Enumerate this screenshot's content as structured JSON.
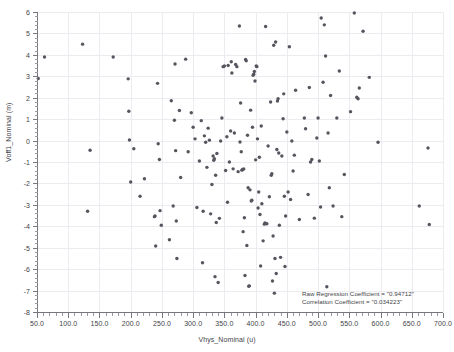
{
  "chart_data": {
    "type": "scatter",
    "title": "",
    "xlabel": "Vhys_Nominal (u)",
    "ylabel": "Voff1_Nominal (m)",
    "xlim": [
      50,
      700
    ],
    "ylim": [
      -8,
      6
    ],
    "grid": true,
    "legend": null,
    "xticks": [
      "50.0",
      "100.0",
      "150.0",
      "200.0",
      "250.0",
      "300.0",
      "350.0",
      "400.0",
      "450.0",
      "500.0",
      "550.0",
      "600.0",
      "650.0",
      "700.0"
    ],
    "xtick_values": [
      50,
      100,
      150,
      200,
      250,
      300,
      350,
      400,
      450,
      500,
      550,
      600,
      650,
      700
    ],
    "yticks": [
      "6",
      "5",
      "4",
      "3",
      "2",
      "1",
      "0",
      "-1",
      "-2",
      "-3",
      "-4",
      "-5",
      "-6",
      "-7",
      "-8"
    ],
    "ytick_values": [
      6,
      5,
      4,
      3,
      2,
      1,
      0,
      -1,
      -2,
      -3,
      -4,
      -5,
      -6,
      -7,
      -8
    ],
    "marker_color": "#55555e",
    "grid_color": "#ececf0",
    "axis_color": "#76767e",
    "annotations": [
      "Raw Regression Coefficient = \"0.94712\"",
      "Correlation Coefficient = \"0.034223\""
    ],
    "points": [
      [
        52,
        2.9
      ],
      [
        62,
        3.9
      ],
      [
        123,
        4.5
      ],
      [
        131,
        -3.3
      ],
      [
        135,
        -0.45
      ],
      [
        172,
        3.9
      ],
      [
        196,
        2.88
      ],
      [
        197,
        1.37
      ],
      [
        198,
        0.03
      ],
      [
        200,
        -1.93
      ],
      [
        205,
        -0.38
      ],
      [
        215,
        -2.6
      ],
      [
        222,
        -1.78
      ],
      [
        238,
        -3.55
      ],
      [
        239,
        -3.52
      ],
      [
        240,
        -4.92
      ],
      [
        243,
        2.67
      ],
      [
        244,
        -0.15
      ],
      [
        246,
        -0.88
      ],
      [
        247,
        -3.27
      ],
      [
        249,
        -3.95
      ],
      [
        262,
        -4.63
      ],
      [
        265,
        1.86
      ],
      [
        268,
        -3.05
      ],
      [
        270,
        0.95
      ],
      [
        271,
        3.57
      ],
      [
        272,
        -0.47
      ],
      [
        273,
        -3.75
      ],
      [
        274,
        -5.5
      ],
      [
        278,
        1.4
      ],
      [
        280,
        -1.72
      ],
      [
        288,
        3.8
      ],
      [
        292,
        -0.52
      ],
      [
        297,
        1.3
      ],
      [
        300,
        0.62
      ],
      [
        303,
        0.08
      ],
      [
        306,
        -3.12
      ],
      [
        310,
        -0.95
      ],
      [
        313,
        0.93
      ],
      [
        315,
        -5.7
      ],
      [
        316,
        -3.3
      ],
      [
        318,
        0.22
      ],
      [
        320,
        -0.08
      ],
      [
        322,
        -1.25
      ],
      [
        324,
        0.58
      ],
      [
        326,
        0.02
      ],
      [
        328,
        -3.42
      ],
      [
        330,
        -2.05
      ],
      [
        332,
        -0.72
      ],
      [
        333,
        -0.92
      ],
      [
        334,
        -0.85
      ],
      [
        335,
        -6.35
      ],
      [
        336,
        -1.62
      ],
      [
        337,
        -3.82
      ],
      [
        338,
        -0.6
      ],
      [
        340,
        -6.62
      ],
      [
        342,
        -3.63
      ],
      [
        344,
        -0.02
      ],
      [
        346,
        1.05
      ],
      [
        348,
        3.45
      ],
      [
        350,
        3.48
      ],
      [
        352,
        -1.4
      ],
      [
        354,
        0.18
      ],
      [
        355,
        -2.88
      ],
      [
        356,
        3.5
      ],
      [
        358,
        -1.0
      ],
      [
        360,
        0.45
      ],
      [
        361,
        3.68
      ],
      [
        362,
        3.15
      ],
      [
        364,
        -1.32
      ],
      [
        366,
        0.35
      ],
      [
        368,
        3.55
      ],
      [
        370,
        3.45
      ],
      [
        372,
        -1.45
      ],
      [
        374,
        5.35
      ],
      [
        375,
        -0.07
      ],
      [
        376,
        1.75
      ],
      [
        377,
        -0.52
      ],
      [
        378,
        -1.38
      ],
      [
        379,
        -1.35
      ],
      [
        380,
        -4.25
      ],
      [
        381,
        -1.33
      ],
      [
        382,
        -3.6
      ],
      [
        383,
        -6.3
      ],
      [
        384,
        3.78
      ],
      [
        385,
        3.72
      ],
      [
        386,
        -4.9
      ],
      [
        387,
        0.25
      ],
      [
        388,
        -2.2
      ],
      [
        389,
        -6.8
      ],
      [
        390,
        -6.78
      ],
      [
        391,
        -2.3
      ],
      [
        392,
        1.42
      ],
      [
        393,
        -2.82
      ],
      [
        394,
        -2.78
      ],
      [
        395,
        0.62
      ],
      [
        396,
        3.05
      ],
      [
        397,
        3.1
      ],
      [
        398,
        3.22
      ],
      [
        399,
        2.78
      ],
      [
        400,
        -0.9
      ],
      [
        401,
        3.48
      ],
      [
        402,
        3.45
      ],
      [
        403,
        0.08
      ],
      [
        404,
        -3.15
      ],
      [
        405,
        -2.4
      ],
      [
        406,
        -0.78
      ],
      [
        407,
        -3.45
      ],
      [
        408,
        -5.85
      ],
      [
        409,
        0.68
      ],
      [
        410,
        -2.95
      ],
      [
        412,
        -4.68
      ],
      [
        414,
        -3.9
      ],
      [
        415,
        -3.85
      ],
      [
        416,
        5.32
      ],
      [
        418,
        -3.88
      ],
      [
        420,
        -0.25
      ],
      [
        422,
        -2.62
      ],
      [
        424,
        1.8
      ],
      [
        425,
        -1.62
      ],
      [
        426,
        -1.55
      ],
      [
        427,
        -6.55
      ],
      [
        428,
        -4.45
      ],
      [
        429,
        4.45
      ],
      [
        430,
        -7.12
      ],
      [
        431,
        -5.5
      ],
      [
        432,
        4.6
      ],
      [
        433,
        -6.2
      ],
      [
        434,
        -0.42
      ],
      [
        435,
        1.85
      ],
      [
        436,
        1.95
      ],
      [
        437,
        -0.58
      ],
      [
        438,
        -3.95
      ],
      [
        440,
        -5.45
      ],
      [
        442,
        -0.72
      ],
      [
        444,
        1.02
      ],
      [
        445,
        2.18
      ],
      [
        446,
        -2.6
      ],
      [
        447,
        -5.88
      ],
      [
        448,
        -3.52
      ],
      [
        450,
        0.4
      ],
      [
        452,
        -2.4
      ],
      [
        454,
        4.38
      ],
      [
        456,
        -2.75
      ],
      [
        458,
        -0.02
      ],
      [
        460,
        -1.42
      ],
      [
        462,
        -0.68
      ],
      [
        464,
        2.35
      ],
      [
        470,
        -3.68
      ],
      [
        478,
        1.05
      ],
      [
        480,
        0.55
      ],
      [
        484,
        -2.52
      ],
      [
        486,
        2.48
      ],
      [
        488,
        -1.0
      ],
      [
        490,
        -0.88
      ],
      [
        494,
        -3.62
      ],
      [
        498,
        0.12
      ],
      [
        500,
        1.05
      ],
      [
        502,
        -0.95
      ],
      [
        504,
        -3.1
      ],
      [
        505,
        5.72
      ],
      [
        508,
        2.72
      ],
      [
        510,
        5.4
      ],
      [
        512,
        3.95
      ],
      [
        514,
        -6.82
      ],
      [
        516,
        0.35
      ],
      [
        518,
        -2.2
      ],
      [
        520,
        2.1
      ],
      [
        524,
        -3.05
      ],
      [
        530,
        1.05
      ],
      [
        534,
        3.25
      ],
      [
        538,
        -3.55
      ],
      [
        542,
        -1.58
      ],
      [
        552,
        1.35
      ],
      [
        558,
        5.95
      ],
      [
        562,
        2.02
      ],
      [
        564,
        1.95
      ],
      [
        566,
        2.45
      ],
      [
        572,
        5.1
      ],
      [
        582,
        2.95
      ],
      [
        596,
        -0.08
      ],
      [
        662,
        -3.05
      ],
      [
        678,
        -3.92
      ],
      [
        676,
        -0.35
      ]
    ]
  }
}
